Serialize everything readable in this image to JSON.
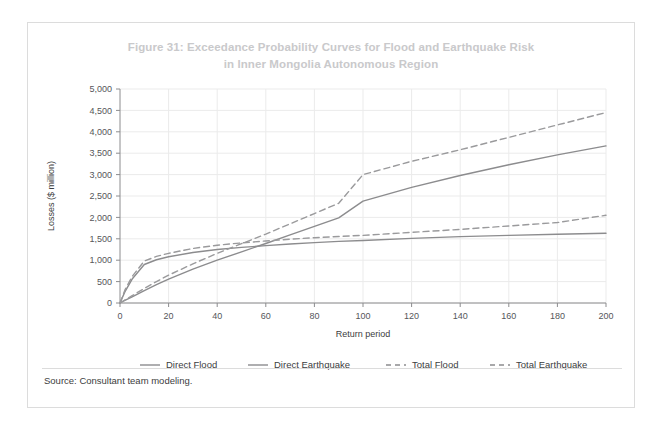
{
  "figure": {
    "title_line1": "Figure 31: Exceedance Probability Curves for Flood and Earthquake Risk",
    "title_line2": "in Inner Mongolia Autonomous Region",
    "source": "Source: Consultant team modeling.",
    "title_color": "#c9c9cb",
    "border_color": "#dcdcdc",
    "background_color": "#ffffff"
  },
  "chart_data": {
    "type": "line",
    "title": "Figure 31: Exceedance Probability Curves for Flood and Earthquake Risk in Inner Mongolia Autonomous Region",
    "xlabel": "Return period",
    "ylabel": "Losses ($ million)",
    "xlim": [
      0,
      200
    ],
    "ylim": [
      0,
      5000
    ],
    "xticks": [
      0,
      20,
      40,
      60,
      80,
      100,
      120,
      140,
      160,
      180,
      200
    ],
    "yticks": [
      0,
      500,
      1000,
      1500,
      2000,
      2500,
      3000,
      3500,
      4000,
      4500,
      5000
    ],
    "ytick_labels": [
      "0",
      "500",
      "1,000",
      "1,500",
      "2,000",
      "2,500",
      "3,000",
      "3,500",
      "4,000",
      "4,500",
      "5,000"
    ],
    "xtick_labels": [
      "0",
      "20",
      "40",
      "60",
      "80",
      "100",
      "120",
      "140",
      "160",
      "180",
      "200"
    ],
    "grid": true,
    "grid_color": "#ebebeb",
    "legend_position": "bottom",
    "x": [
      0,
      2,
      5,
      10,
      15,
      20,
      30,
      40,
      50,
      60,
      70,
      80,
      90,
      100,
      120,
      140,
      160,
      180,
      200
    ],
    "series": [
      {
        "name": "Direct Flood",
        "style": "solid",
        "color": "#8c8c8e",
        "values": [
          0,
          260,
          560,
          900,
          1010,
          1080,
          1180,
          1250,
          1300,
          1340,
          1380,
          1410,
          1440,
          1460,
          1510,
          1550,
          1580,
          1605,
          1630
        ]
      },
      {
        "name": "Direct Earthquake",
        "style": "solid",
        "color": "#8c8c8e",
        "values": [
          0,
          60,
          145,
          290,
          430,
          560,
          790,
          1000,
          1195,
          1390,
          1590,
          1790,
          1990,
          2380,
          2700,
          2980,
          3230,
          3460,
          3670
        ]
      },
      {
        "name": "Total Flood",
        "style": "dashed",
        "color": "#9a9a9c",
        "values": [
          0,
          300,
          620,
          980,
          1090,
          1160,
          1275,
          1350,
          1405,
          1450,
          1490,
          1525,
          1555,
          1580,
          1650,
          1720,
          1800,
          1880,
          2050
        ]
      },
      {
        "name": "Total Earthquake",
        "style": "dashed",
        "color": "#9a9a9c",
        "values": [
          0,
          70,
          170,
          340,
          500,
          650,
          915,
          1160,
          1385,
          1610,
          1850,
          2090,
          2330,
          3000,
          3310,
          3580,
          3870,
          4160,
          4450
        ]
      }
    ],
    "legend": [
      {
        "label": "Direct Flood",
        "style": "solid"
      },
      {
        "label": "Direct Earthquake",
        "style": "solid"
      },
      {
        "label": "Total Flood",
        "style": "dashed"
      },
      {
        "label": "Total Earthquake",
        "style": "dashed"
      }
    ]
  }
}
